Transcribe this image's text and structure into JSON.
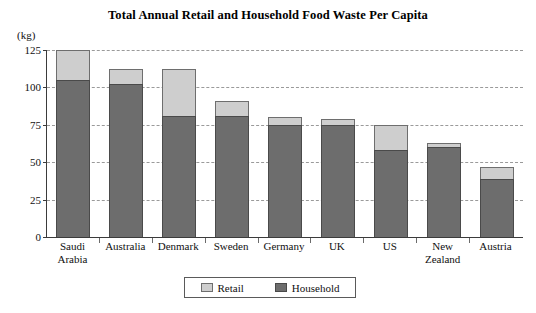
{
  "chart_data": {
    "type": "bar",
    "subtype": "stacked-vertical",
    "title": "Total Annual Retail and Household Food Waste Per Capita",
    "unit_label": "(kg)",
    "xlabel": "",
    "ylabel": "",
    "ylim": [
      0,
      125
    ],
    "yticks": [
      0,
      25,
      50,
      75,
      100,
      125
    ],
    "ytick_labels": [
      "0",
      "25",
      "50",
      "75",
      "100",
      "125"
    ],
    "grid": true,
    "grid_style": "dashed-horizontal",
    "legend": {
      "position": "bottom-center",
      "entries": [
        {
          "name": "Retail",
          "color": "#cecece"
        },
        {
          "name": "Household",
          "color": "#6d6d6d"
        }
      ]
    },
    "categories": [
      "Saudi Arabia",
      "Australia",
      "Denmark",
      "Sweden",
      "Germany",
      "UK",
      "US",
      "New Zealand",
      "Austria"
    ],
    "category_lines": [
      [
        "Saudi",
        "Arabia"
      ],
      [
        "Australia",
        ""
      ],
      [
        "Denmark",
        ""
      ],
      [
        "Sweden",
        ""
      ],
      [
        "Germany",
        ""
      ],
      [
        "UK",
        ""
      ],
      [
        "US",
        ""
      ],
      [
        "New",
        "Zealand"
      ],
      [
        "Austria",
        ""
      ]
    ],
    "series": [
      {
        "name": "Household",
        "color": "#6d6d6d",
        "values": [
          105,
          102,
          81,
          81,
          75,
          75,
          58,
          60,
          39
        ]
      },
      {
        "name": "Retail",
        "color": "#cecece",
        "values": [
          20,
          10,
          31,
          10,
          5,
          4,
          17,
          3,
          8
        ]
      }
    ],
    "totals": [
      125,
      112,
      112,
      91,
      80,
      79,
      75,
      63,
      47
    ]
  }
}
